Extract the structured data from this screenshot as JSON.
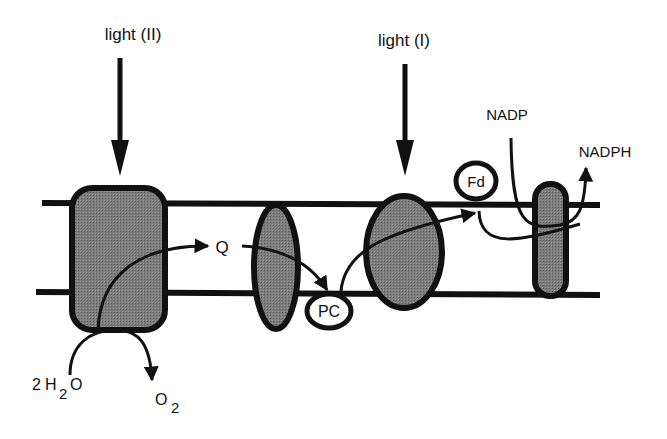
{
  "diagram": {
    "colors": {
      "stroke": "#111111",
      "protein_fill": "#7a7a7a",
      "background": "#ffffff"
    },
    "labels": {
      "light_ii": "light (II)",
      "light_i": "light (I)",
      "q": "Q",
      "pc": "PC",
      "fd": "Fd",
      "nadp": "NADP",
      "nadph": "NADPH",
      "water_coef": "2",
      "water_h": "H",
      "water_sub": "2",
      "water_o": "O",
      "oxygen_o": "O",
      "oxygen_sub": "2"
    },
    "nodes": [
      {
        "id": "photosystem-ii",
        "shape": "rounded-rect"
      },
      {
        "id": "cytochrome-complex",
        "shape": "ellipse"
      },
      {
        "id": "photosystem-i",
        "shape": "ellipse"
      },
      {
        "id": "nadp-reductase",
        "shape": "capsule"
      },
      {
        "id": "q",
        "shape": "text"
      },
      {
        "id": "pc",
        "shape": "circle-label"
      },
      {
        "id": "fd",
        "shape": "circle-label"
      }
    ],
    "edges": [
      {
        "from": "light_ii",
        "to": "photosystem-ii"
      },
      {
        "from": "light_i",
        "to": "photosystem-i"
      },
      {
        "from": "2H2O",
        "to": "O2",
        "via": "photosystem-ii"
      },
      {
        "from": "photosystem-ii",
        "to": "q"
      },
      {
        "from": "q",
        "to": "pc",
        "via": "cytochrome-complex"
      },
      {
        "from": "pc",
        "to": "fd",
        "via": "photosystem-i"
      },
      {
        "from": "fd",
        "to": "nadp-reductase"
      },
      {
        "from": "nadp",
        "to": "nadph",
        "via": "nadp-reductase"
      }
    ]
  }
}
